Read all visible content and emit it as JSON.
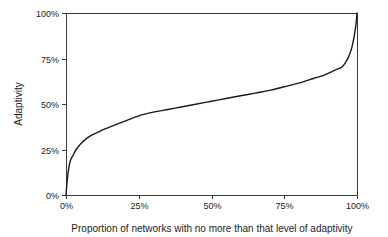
{
  "chart_data": {
    "type": "line",
    "title": "",
    "xlabel": "Proportion of networks with no more than that level of adaptivity",
    "ylabel": "Adaptivity",
    "xlim": [
      0,
      100
    ],
    "ylim": [
      0,
      100
    ],
    "grid": false,
    "legend": null,
    "xticks": [
      "0%",
      "25%",
      "50%",
      "75%",
      "100%"
    ],
    "xtick_values": [
      0,
      25,
      50,
      75,
      100
    ],
    "yticks": [
      "0%",
      "25%",
      "50%",
      "75%",
      "100%"
    ],
    "ytick_values": [
      0,
      25,
      50,
      75,
      100
    ],
    "series": [
      {
        "name": "Cumulative distribution of adaptivity",
        "x": [
          0,
          0.3,
          0.7,
          1.2,
          1.8,
          2.5,
          3.5,
          5,
          7,
          9,
          11,
          13,
          16,
          20,
          25,
          30,
          35,
          40,
          45,
          50,
          55,
          60,
          65,
          70,
          75,
          80,
          85,
          88,
          91,
          93,
          94.5,
          95.5,
          96.5,
          97.5,
          98.3,
          99,
          99.5,
          99.8,
          100
        ],
        "y": [
          0,
          6,
          12,
          17,
          20,
          22,
          25,
          28,
          31,
          33,
          34.5,
          36,
          38,
          40.5,
          43.5,
          45.5,
          47,
          48.5,
          50,
          51.5,
          53,
          54.5,
          56,
          57.5,
          59.5,
          61.5,
          64,
          65.5,
          67.5,
          69,
          70,
          71.5,
          74,
          77.5,
          81.5,
          87,
          92,
          96,
          100
        ]
      }
    ],
    "colors": {
      "curve": "#1a1a1a",
      "axis": "#3a3a3a",
      "text": "#1b1b1b",
      "background": "#ffffff"
    }
  },
  "geometry": {
    "plot_left": 66,
    "plot_right": 357,
    "plot_top": 13,
    "plot_bottom": 195
  }
}
